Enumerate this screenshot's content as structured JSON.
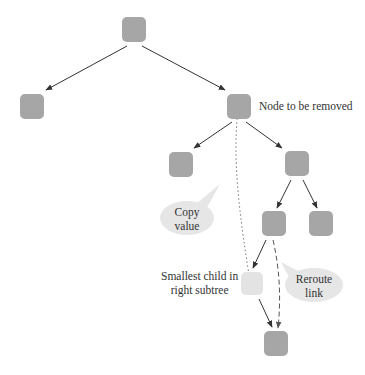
{
  "diagram": {
    "type": "binary-search-tree-deletion",
    "labels": {
      "node_to_remove": "Node to be removed",
      "smallest_child_line1": "Smallest child in",
      "smallest_child_line2": "right subtree"
    },
    "callouts": {
      "copy_value_line1": "Copy",
      "copy_value_line2": "value",
      "reroute_line1": "Reroute",
      "reroute_line2": "link"
    },
    "colors": {
      "node": "#a6a6a6",
      "highlight_node": "#e3e3e3",
      "bubble": "#e6e6e6",
      "edge": "#333333"
    },
    "nodes": [
      {
        "id": "root",
        "x": 122,
        "y": 17
      },
      {
        "id": "left-child",
        "x": 20,
        "y": 94
      },
      {
        "id": "node-to-remove",
        "x": 227,
        "y": 94
      },
      {
        "id": "removed-left",
        "x": 169,
        "y": 152
      },
      {
        "id": "removed-right",
        "x": 285,
        "y": 151
      },
      {
        "id": "right-left",
        "x": 262,
        "y": 211
      },
      {
        "id": "right-right",
        "x": 309,
        "y": 211
      },
      {
        "id": "smallest-child",
        "x": 241,
        "y": 272,
        "highlight": true
      },
      {
        "id": "smallest-child-right",
        "x": 264,
        "y": 331
      }
    ]
  }
}
